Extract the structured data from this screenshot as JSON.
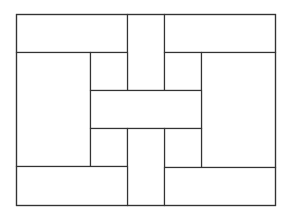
{
  "diagram": {
    "type": "basket-weave-rectangle-tiling",
    "stroke_color": "#333333",
    "background_color": "#ffffff",
    "outer": {
      "x": 16,
      "y": 14,
      "w": 259,
      "h": 191
    },
    "rects": [
      {
        "id": "top-left-bar",
        "x": 16,
        "y": 14,
        "w": 111,
        "h": 38
      },
      {
        "id": "top-center-strip",
        "x": 127,
        "y": 14,
        "w": 37,
        "h": 76
      },
      {
        "id": "top-right-bar",
        "x": 164,
        "y": 14,
        "w": 111,
        "h": 38
      },
      {
        "id": "left-tall",
        "x": 16,
        "y": 52,
        "w": 74,
        "h": 114
      },
      {
        "id": "upper-left-square",
        "x": 90,
        "y": 52,
        "w": 37,
        "h": 38
      },
      {
        "id": "upper-right-square",
        "x": 164,
        "y": 52,
        "w": 37,
        "h": 38
      },
      {
        "id": "right-tall",
        "x": 201,
        "y": 52,
        "w": 74,
        "h": 115
      },
      {
        "id": "center-bar",
        "x": 90,
        "y": 90,
        "w": 111,
        "h": 38
      },
      {
        "id": "lower-left-square",
        "x": 90,
        "y": 128,
        "w": 37,
        "h": 38
      },
      {
        "id": "lower-right-square",
        "x": 164,
        "y": 128,
        "w": 37,
        "h": 39
      },
      {
        "id": "bottom-center-strip",
        "x": 127,
        "y": 128,
        "w": 37,
        "h": 77
      },
      {
        "id": "bottom-left-bar",
        "x": 16,
        "y": 166,
        "w": 111,
        "h": 39
      },
      {
        "id": "bottom-right-bar",
        "x": 164,
        "y": 167,
        "w": 111,
        "h": 38
      }
    ]
  }
}
